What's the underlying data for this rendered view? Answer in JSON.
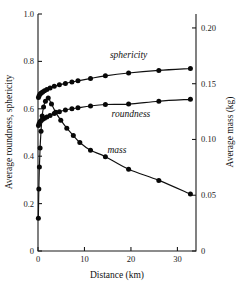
{
  "chart_data": {
    "type": "line",
    "title": "",
    "xlabel": "Distance (km)",
    "ylabel": "Average roundness, sphericity",
    "ylabel_right": "Average mass (kg)",
    "xlim": [
      0,
      34
    ],
    "ylim": [
      0,
      1.0
    ],
    "ylim_right": [
      0,
      0.2125
    ],
    "grid": false,
    "legend": "inline-annotations",
    "xticks": [
      0,
      10,
      20,
      30
    ],
    "xticklabels": [
      "0",
      "10",
      "20",
      "30"
    ],
    "yticks": [
      0,
      0.2,
      0.4,
      0.6,
      0.8,
      1.0
    ],
    "yticklabels": [
      "0",
      "0.2",
      "0.4",
      "0.6",
      "0.8",
      "1.0"
    ],
    "yticks_right": [
      0,
      0.05,
      0.1,
      0.15,
      0.2
    ],
    "yticklabels_right": [
      "0",
      "0.05",
      "0.10",
      "0.15",
      "0.20"
    ],
    "series": [
      {
        "name": "sphericity",
        "axis": "left",
        "label": "sphericity",
        "label_x": 19.5,
        "label_y": 0.815,
        "x": [
          0.1,
          0.25,
          0.45,
          0.7,
          1.0,
          1.4,
          1.9,
          2.6,
          3.5,
          4.6,
          5.9,
          7.3,
          8.6,
          11.3,
          14.5,
          19.5,
          26.0,
          32.8
        ],
        "y": [
          0.648,
          0.655,
          0.662,
          0.667,
          0.671,
          0.676,
          0.681,
          0.688,
          0.695,
          0.701,
          0.707,
          0.713,
          0.718,
          0.728,
          0.739,
          0.751,
          0.762,
          0.77
        ]
      },
      {
        "name": "roundness",
        "axis": "left",
        "label": "roundness",
        "label_x": 20.0,
        "label_y": 0.565,
        "x": [
          0.1,
          0.25,
          0.45,
          0.7,
          1.0,
          1.4,
          1.9,
          2.6,
          3.5,
          4.6,
          5.9,
          7.3,
          8.6,
          11.3,
          14.5,
          19.5,
          26.0,
          32.8
        ],
        "y": [
          0.53,
          0.538,
          0.545,
          0.551,
          0.556,
          0.56,
          0.565,
          0.572,
          0.58,
          0.588,
          0.595,
          0.6,
          0.604,
          0.612,
          0.618,
          0.62,
          0.632,
          0.64
        ]
      },
      {
        "name": "mass",
        "axis": "right",
        "label": "mass",
        "label_x": 17.0,
        "label_y": 0.415,
        "x": [
          0.08,
          0.18,
          0.3,
          0.45,
          0.65,
          0.9,
          1.2,
          1.6,
          2.2,
          2.9,
          3.8,
          4.9,
          6.2,
          7.6,
          9.0,
          11.3,
          14.5,
          19.5,
          26.0,
          32.8
        ],
        "y_left_equiv": [
          0.138,
          0.262,
          0.355,
          0.435,
          0.505,
          0.57,
          0.608,
          0.632,
          0.645,
          0.62,
          0.585,
          0.552,
          0.518,
          0.487,
          0.458,
          0.425,
          0.398,
          0.345,
          0.298,
          0.24
        ],
        "y_right_kg": [
          0.0293,
          0.0557,
          0.0754,
          0.0924,
          0.1073,
          0.1211,
          0.1292,
          0.1343,
          0.1371,
          0.1318,
          0.1243,
          0.1173,
          0.1101,
          0.1035,
          0.0973,
          0.0903,
          0.0846,
          0.0733,
          0.0633,
          0.051
        ]
      }
    ]
  },
  "style": {
    "line_color": "#101010",
    "point_color": "#080808",
    "axis_color": "#1a1a1a",
    "background": "#ffffff"
  }
}
